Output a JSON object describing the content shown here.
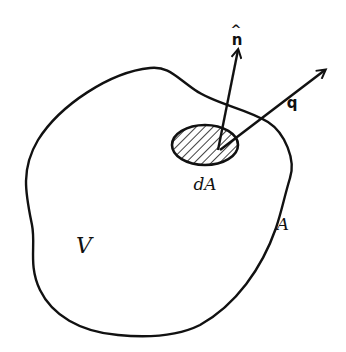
{
  "diagram": {
    "type": "control-volume-flux",
    "colors": {
      "stroke": "#111111",
      "background": "#ffffff"
    },
    "labels": {
      "normal_vector": "n",
      "normal_hat": "^",
      "flux_vector": "q",
      "area_element": "dA",
      "surface": "A",
      "volume": "V"
    },
    "elements": [
      {
        "id": "volume-boundary",
        "kind": "closed-curve",
        "label_ref": "surface"
      },
      {
        "id": "area-element",
        "kind": "hatched-ellipse",
        "label_ref": "area_element"
      },
      {
        "id": "normal-arrow",
        "kind": "arrow",
        "label_ref": "normal_vector"
      },
      {
        "id": "flux-arrow",
        "kind": "arrow",
        "label_ref": "flux_vector"
      },
      {
        "id": "volume-label",
        "kind": "text",
        "label_ref": "volume"
      }
    ]
  }
}
